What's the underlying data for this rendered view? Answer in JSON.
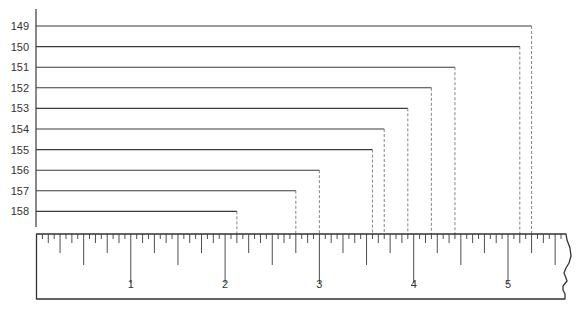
{
  "diagram": {
    "type": "ruler-measurement-diagram",
    "row_labels": [
      "149",
      "150",
      "151",
      "152",
      "153",
      "154",
      "155",
      "156",
      "157",
      "158"
    ],
    "measurements_inches": [
      5.25,
      5.125,
      4.4375,
      4.1875,
      3.9375,
      3.6875,
      3.5625,
      3.0,
      2.75,
      2.125
    ],
    "ruler": {
      "inch_labels": [
        "1",
        "2",
        "3",
        "4",
        "5"
      ],
      "max_inches": 5.625,
      "subdivisions_per_inch": 16,
      "torn_right_edge": true
    },
    "colors": {
      "line": "#3a3a3a",
      "dashed": "#777777",
      "text": "#333333",
      "ruler_border": "#333333",
      "background": "#ffffff"
    }
  },
  "chart_data": {
    "type": "table",
    "title": "",
    "xlabel": "inches",
    "ylabel": "",
    "categories": [
      "149",
      "150",
      "151",
      "152",
      "153",
      "154",
      "155",
      "156",
      "157",
      "158"
    ],
    "values": [
      5.25,
      5.125,
      4.4375,
      4.1875,
      3.9375,
      3.6875,
      3.5625,
      3.0,
      2.75,
      2.125
    ],
    "xlim": [
      0,
      5.6
    ],
    "x_tick_labels": [
      "1",
      "2",
      "3",
      "4",
      "5"
    ],
    "grid": false
  }
}
